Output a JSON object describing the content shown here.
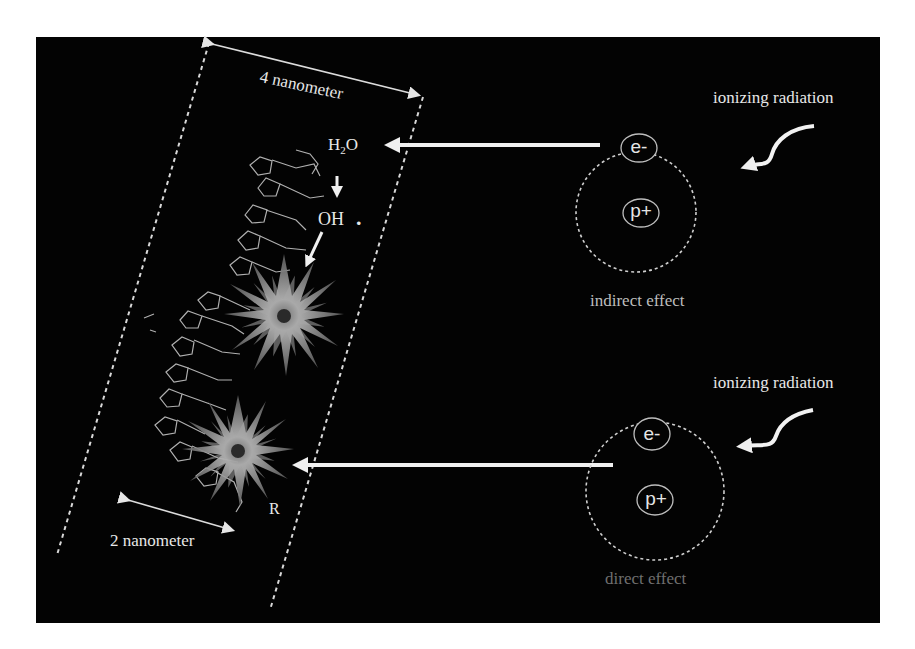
{
  "figure": {
    "background": "#000000",
    "page_background": "#ffffff",
    "accent_colors": {
      "text_primary": "#e8e8e8",
      "text_indirect_label": "#bdbdbd",
      "text_direct_label": "#6f6f6f",
      "dashed_lines": "#d8d8d8",
      "arrows": "#f0f0f0",
      "starburst": "#9a9a9a"
    }
  },
  "dna_region": {
    "width_label": "4 nanometer",
    "helix_label": "2 nanometer",
    "radical_label": "R",
    "water_label_main": "H",
    "water_label_sub": "2",
    "water_label_tail": "O",
    "hydroxyl_label": "OH",
    "radical_dot": "."
  },
  "indirect": {
    "source_label": "ionizing radiation",
    "electron_label": "e-",
    "proton_label": "p+",
    "effect_label": "indirect effect"
  },
  "direct": {
    "source_label": "ionizing radiation",
    "electron_label": "e-",
    "proton_label": "p+",
    "effect_label": "direct effect"
  },
  "icons": {
    "starburst": "damage-starburst-icon",
    "arrow": "left-arrow-icon",
    "wavy_arrow": "radiation-wave-arrow-icon",
    "atom": "atom-orbit-icon",
    "dna": "dna-helix-icon"
  }
}
